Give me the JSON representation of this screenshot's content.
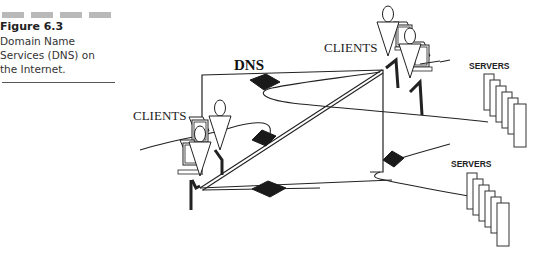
{
  "caption": {
    "figure_number": "Figure 6.3",
    "lines": [
      "Domain Name",
      "Services (DNS) on",
      "the Internet."
    ]
  },
  "diagram": {
    "dns_label": "DNS",
    "clients_top_label": "CLIENTS",
    "clients_left_label": "CLIENTS",
    "servers_top_label": "SERVERS",
    "servers_bottom_label": "SERVERS",
    "nodes": [
      {
        "id": "dns",
        "type": "name-server-box",
        "label": "DNS"
      },
      {
        "id": "clients-top",
        "type": "client-group",
        "label": "CLIENTS"
      },
      {
        "id": "clients-left",
        "type": "client-group",
        "label": "CLIENTS"
      },
      {
        "id": "servers-top",
        "type": "server-stack",
        "label": "SERVERS"
      },
      {
        "id": "servers-bottom",
        "type": "server-stack",
        "label": "SERVERS"
      }
    ],
    "router_icons": 4,
    "colors": {
      "line": "#222222",
      "router": "#1a1a1a",
      "caption_bar": "#b9b9b9"
    }
  }
}
